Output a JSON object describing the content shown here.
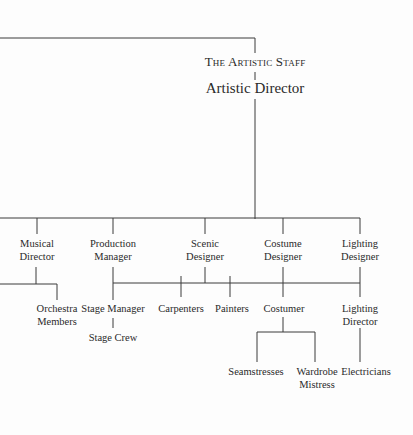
{
  "chart": {
    "title": "The Artistic Staff",
    "root": "Artistic Director",
    "level1": [
      {
        "line1": "Musical",
        "line2": "Director"
      },
      {
        "line1": "Production",
        "line2": "Manager"
      },
      {
        "line1": "Scenic",
        "line2": "Designer"
      },
      {
        "line1": "Costume",
        "line2": "Designer"
      },
      {
        "line1": "Lighting",
        "line2": "Designer"
      }
    ],
    "level2": [
      {
        "line1": "Orchestra",
        "line2": "Members"
      },
      {
        "line1": "Stage Manager"
      },
      {
        "line1": "Carpenters"
      },
      {
        "line1": "Painters"
      },
      {
        "line1": "Costumer"
      },
      {
        "line1": "Lighting",
        "line2": "Director"
      }
    ],
    "level3": [
      {
        "line1": "Stage Crew"
      },
      {
        "line1": "Seamstresses"
      },
      {
        "line1": "Wardrobe",
        "line2": "Mistress"
      },
      {
        "line1": "Electricians"
      }
    ],
    "line_color": "#3a3a3a"
  }
}
